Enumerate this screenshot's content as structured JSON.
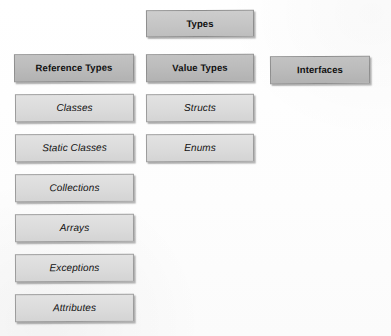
{
  "diagram": {
    "title": "Types",
    "kind": "type-hierarchy",
    "background_color": "#ffffff",
    "head_fill": "#bcbcbc",
    "root_fill": "#c6c6c6",
    "leaf_fill": "#dcdcdc",
    "border_color": "#8d8d8d",
    "text_color": "#111111"
  },
  "nodes": {
    "root": {
      "label": "Types",
      "level": "root",
      "column": "middle"
    },
    "reference_types": {
      "label": "Reference Types",
      "level": "head",
      "column": "left"
    },
    "value_types": {
      "label": "Value Types",
      "level": "head",
      "column": "middle"
    },
    "interfaces": {
      "label": "Interfaces",
      "level": "head",
      "column": "right"
    }
  },
  "columns": {
    "left": {
      "header": "Reference Types",
      "members": [
        {
          "label": "Classes"
        },
        {
          "label": "Static Classes"
        },
        {
          "label": "Collections"
        },
        {
          "label": "Arrays"
        },
        {
          "label": "Exceptions"
        },
        {
          "label": "Attributes"
        }
      ]
    },
    "middle": {
      "header": "Value Types",
      "members": [
        {
          "label": "Structs"
        },
        {
          "label": "Enums"
        }
      ]
    },
    "right": {
      "header": "Interfaces",
      "members": []
    }
  }
}
